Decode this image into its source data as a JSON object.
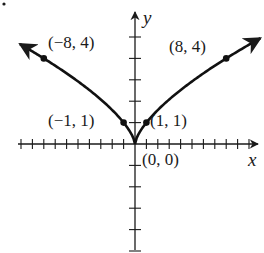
{
  "chart_data": {
    "type": "line",
    "title": "",
    "function": "y = x^(2/3)",
    "xlabel": "x",
    "ylabel": "y",
    "xlim": [
      -10,
      11
    ],
    "ylim": [
      -5,
      6
    ],
    "grid": false,
    "legend": null,
    "x_ticks": [
      -10,
      -9,
      -8,
      -7,
      -6,
      -5,
      -4,
      -3,
      -2,
      -1,
      1,
      2,
      3,
      4,
      5,
      6,
      7,
      8,
      9,
      10
    ],
    "y_ticks": [
      -5,
      -4,
      -3,
      -2,
      -1,
      1,
      2,
      3,
      4,
      5
    ],
    "series": [
      {
        "name": "y = x^(2/3)",
        "x": [
          -10,
          -8,
          -6,
          -4,
          -3,
          -2,
          -1,
          -0.5,
          0,
          0.5,
          1,
          2,
          3,
          4,
          6,
          8,
          11
        ],
        "y": [
          4.64,
          4,
          3.3,
          2.52,
          2.08,
          1.59,
          1,
          0.63,
          0,
          0.63,
          1,
          1.59,
          2.08,
          2.52,
          3.3,
          4,
          4.95
        ]
      }
    ],
    "labeled_points": [
      {
        "x": -8,
        "y": 4,
        "label": "(−8, 4)"
      },
      {
        "x": 8,
        "y": 4,
        "label": "(8, 4)"
      },
      {
        "x": -1,
        "y": 1,
        "label": "(−1, 1)"
      },
      {
        "x": 1,
        "y": 1,
        "label": "(1, 1)"
      },
      {
        "x": 0,
        "y": 0,
        "label": "(0, 0)"
      }
    ]
  },
  "labels": {
    "x_axis": "x",
    "y_axis": "y",
    "p_neg8": "(−8, 4)",
    "p_8": "(8, 4)",
    "p_neg1": "(−1, 1)",
    "p_1": "(1, 1)",
    "p_origin": "(0, 0)"
  }
}
